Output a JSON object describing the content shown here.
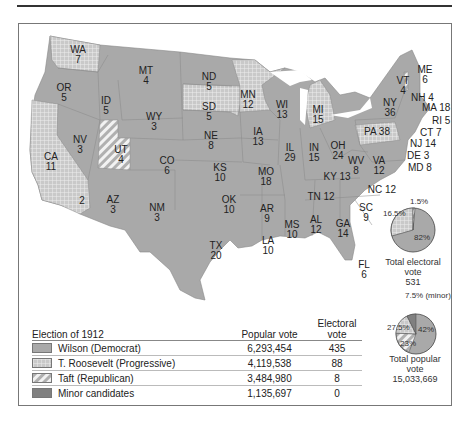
{
  "title": "Election of 1912",
  "colors": {
    "wilson": "#a9a9a9",
    "roosevelt_bg": "#cfcfcf",
    "taft_bg": "#e2e2e2",
    "minor": "#808080",
    "border": "#777777"
  },
  "states": [
    {
      "abbr": "WA",
      "ev": "7",
      "party": "roosevelt"
    },
    {
      "abbr": "OR",
      "ev": "5",
      "party": "wilson"
    },
    {
      "abbr": "CA",
      "ev": "11",
      "party": "roosevelt"
    },
    {
      "abbr": "CA-split",
      "ev": "2",
      "party": "wilson"
    },
    {
      "abbr": "ID",
      "ev": "5",
      "party": "wilson"
    },
    {
      "abbr": "NV",
      "ev": "3",
      "party": "wilson"
    },
    {
      "abbr": "UT",
      "ev": "4",
      "party": "taft"
    },
    {
      "abbr": "AZ",
      "ev": "3",
      "party": "wilson"
    },
    {
      "abbr": "MT",
      "ev": "4",
      "party": "wilson"
    },
    {
      "abbr": "WY",
      "ev": "3",
      "party": "wilson"
    },
    {
      "abbr": "CO",
      "ev": "6",
      "party": "wilson"
    },
    {
      "abbr": "NM",
      "ev": "3",
      "party": "wilson"
    },
    {
      "abbr": "ND",
      "ev": "5",
      "party": "wilson"
    },
    {
      "abbr": "SD",
      "ev": "5",
      "party": "roosevelt"
    },
    {
      "abbr": "NE",
      "ev": "8",
      "party": "wilson"
    },
    {
      "abbr": "KS",
      "ev": "10",
      "party": "wilson"
    },
    {
      "abbr": "OK",
      "ev": "10",
      "party": "wilson"
    },
    {
      "abbr": "TX",
      "ev": "20",
      "party": "wilson"
    },
    {
      "abbr": "MN",
      "ev": "12",
      "party": "roosevelt"
    },
    {
      "abbr": "IA",
      "ev": "13",
      "party": "wilson"
    },
    {
      "abbr": "MO",
      "ev": "18",
      "party": "wilson"
    },
    {
      "abbr": "AR",
      "ev": "9",
      "party": "wilson"
    },
    {
      "abbr": "LA",
      "ev": "10",
      "party": "wilson"
    },
    {
      "abbr": "WI",
      "ev": "13",
      "party": "wilson"
    },
    {
      "abbr": "IL",
      "ev": "29",
      "party": "wilson"
    },
    {
      "abbr": "MI",
      "ev": "15",
      "party": "roosevelt"
    },
    {
      "abbr": "IN",
      "ev": "15",
      "party": "wilson"
    },
    {
      "abbr": "OH",
      "ev": "24",
      "party": "wilson"
    },
    {
      "abbr": "KY",
      "ev": "13",
      "party": "wilson"
    },
    {
      "abbr": "TN",
      "ev": "12",
      "party": "wilson"
    },
    {
      "abbr": "MS",
      "ev": "10",
      "party": "wilson"
    },
    {
      "abbr": "AL",
      "ev": "12",
      "party": "wilson"
    },
    {
      "abbr": "GA",
      "ev": "14",
      "party": "wilson"
    },
    {
      "abbr": "FL",
      "ev": "6",
      "party": "wilson"
    },
    {
      "abbr": "SC",
      "ev": "9",
      "party": "wilson"
    },
    {
      "abbr": "NC",
      "ev": "12",
      "party": "wilson"
    },
    {
      "abbr": "VA",
      "ev": "12",
      "party": "wilson"
    },
    {
      "abbr": "WV",
      "ev": "8",
      "party": "wilson"
    },
    {
      "abbr": "PA",
      "ev": "38",
      "party": "roosevelt"
    },
    {
      "abbr": "NY",
      "ev": "36",
      "party": "wilson"
    },
    {
      "abbr": "VT",
      "ev": "4",
      "party": "taft"
    },
    {
      "abbr": "NH",
      "ev": "4",
      "party": "wilson"
    },
    {
      "abbr": "ME",
      "ev": "6",
      "party": "wilson"
    },
    {
      "abbr": "MA",
      "ev": "18",
      "party": "wilson"
    },
    {
      "abbr": "RI",
      "ev": "5",
      "party": "wilson"
    },
    {
      "abbr": "CT",
      "ev": "7",
      "party": "wilson"
    },
    {
      "abbr": "NJ",
      "ev": "14",
      "party": "wilson"
    },
    {
      "abbr": "DE",
      "ev": "3",
      "party": "wilson"
    },
    {
      "abbr": "MD",
      "ev": "8",
      "party": "wilson"
    }
  ],
  "ne_labels": {
    "nh": "NH 4",
    "ma": "MA 18",
    "ri": "RI 5",
    "ct": "CT 7",
    "nj": "NJ 14",
    "de": "DE 3",
    "md": "MD 8",
    "pa": "PA 38",
    "ky": "KY 13",
    "tn": "TN 12",
    "nc": "NC 12"
  },
  "electoral_pie": {
    "caption": "Total electoral vote",
    "total": "531",
    "slices": [
      {
        "label": "82%",
        "party": "wilson",
        "value": 82
      },
      {
        "label": "16.5%",
        "party": "roosevelt",
        "value": 16.5
      },
      {
        "label": "1.5%",
        "party": "taft",
        "value": 1.5
      }
    ]
  },
  "popular_pie": {
    "caption": "Total popular vote",
    "total": "15,033,669",
    "slices": [
      {
        "label": "42%",
        "party": "wilson",
        "value": 42
      },
      {
        "label": "23%",
        "party": "taft",
        "value": 23
      },
      {
        "label": "27.5%",
        "party": "roosevelt",
        "value": 27.5
      },
      {
        "label": "7.5% (minor)",
        "party": "minor",
        "value": 7.5
      }
    ]
  },
  "legend": {
    "title": "Election of 1912",
    "col_popular": "Popular vote",
    "col_electoral": "Electoral vote",
    "rows": [
      {
        "name": "Wilson (Democrat)",
        "popular": "6,293,454",
        "electoral": "435"
      },
      {
        "name": "T. Roosevelt (Progressive)",
        "popular": "4,119,538",
        "electoral": "88"
      },
      {
        "name": "Taft (Republican)",
        "popular": "3,484,980",
        "electoral": "8"
      },
      {
        "name": "Minor candidates",
        "popular": "1,135,697",
        "electoral": "0"
      }
    ]
  }
}
